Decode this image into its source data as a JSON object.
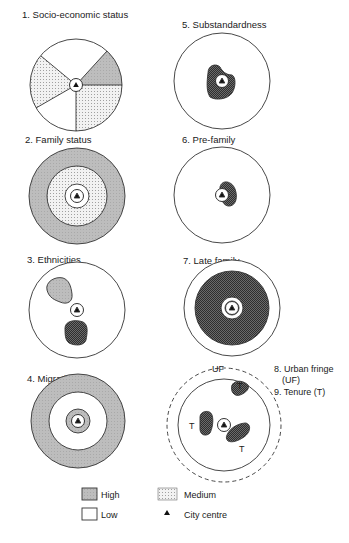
{
  "panels": [
    {
      "id": 1,
      "title": "1. Socio-economic status",
      "pattern": "sectors"
    },
    {
      "id": 2,
      "title": "2. Family status",
      "pattern": "concentric"
    },
    {
      "id": 3,
      "title": "3. Ethnicities",
      "pattern": "clusters"
    },
    {
      "id": 4,
      "title": "4. Migration",
      "pattern": "concentric"
    },
    {
      "id": 5,
      "title": "5. Substandardness",
      "pattern": "central-cluster"
    },
    {
      "id": 6,
      "title": "6. Pre-family",
      "pattern": "central-cluster"
    },
    {
      "id": 7,
      "title": "7. Late family",
      "pattern": "concentric"
    },
    {
      "id": 8,
      "title": "8. Urban fringe",
      "subtitle": "(UF)",
      "pattern": "fringe"
    },
    {
      "id": 9,
      "title": "9. Tenure (T)",
      "pattern": "clusters"
    }
  ],
  "annotations": {
    "uf": "UF",
    "t": "T"
  },
  "legend": {
    "high": "High",
    "medium": "Medium",
    "low": "Low",
    "city_centre": "City centre"
  },
  "colors": {
    "high": "#b8b8b8",
    "medium": "#e2e2e2",
    "low": "#ffffff",
    "dark": "#4a4a4a",
    "stroke": "#333333"
  }
}
